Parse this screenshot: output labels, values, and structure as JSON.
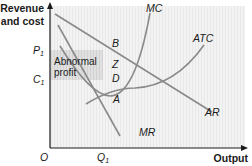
{
  "diagram": {
    "y_axis_label_line1": "Revenue",
    "y_axis_label_line2": "and cost",
    "x_axis_label": "Output",
    "origin_label": "O",
    "price_label": "P",
    "price_subscript": "1",
    "cost_label": "C",
    "cost_subscript": "1",
    "quantity_label": "Q",
    "quantity_subscript": "1",
    "shaded_region_line1": "Abnormal",
    "shaded_region_line2": "profit",
    "curves": {
      "mc": "MC",
      "atc": "ATC",
      "ar": "AR",
      "mr": "MR"
    },
    "points": {
      "b": "B",
      "z": "Z",
      "d": "D",
      "a": "A"
    },
    "colors": {
      "curve": "#8a8a8a",
      "axis": "#1a1a1a",
      "plot_background": "#f1f1f1",
      "shaded_region": "#dcdcdc",
      "text": "#1a1a1a"
    }
  }
}
